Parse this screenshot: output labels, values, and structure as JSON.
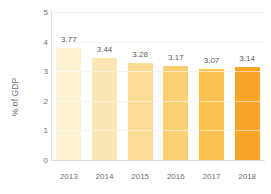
{
  "chart_data": {
    "type": "bar",
    "title": "",
    "subtitle": "",
    "xlabel": "",
    "ylabel": "% of GDP",
    "categories": [
      "2013",
      "2014",
      "2015",
      "2016",
      "2017",
      "2018"
    ],
    "values": [
      3.77,
      3.44,
      3.28,
      3.17,
      3.07,
      3.14
    ],
    "data_labels": [
      "3.77",
      "3.44",
      "3.28",
      "3.17",
      "3.07",
      "3.14"
    ],
    "bar_colors": [
      "#fdf3d3",
      "#fbe7b4",
      "#fbdb95",
      "#fccf72",
      "#fcc14f",
      "#f8a426"
    ],
    "ylim": [
      0,
      5
    ],
    "y_ticks": [
      0,
      1,
      2,
      3,
      4,
      5
    ],
    "y_tick_labels": [
      "0",
      "1",
      "2",
      "3",
      "4",
      "5"
    ],
    "grid": true,
    "grid_color": "#f4f4f4",
    "legend": false,
    "legend_position": "none",
    "axis_color": "#dcdcdc",
    "tick_label_color": "#6f6f6f",
    "data_label_color": "#5a5a5a",
    "background": "#ffffff"
  }
}
